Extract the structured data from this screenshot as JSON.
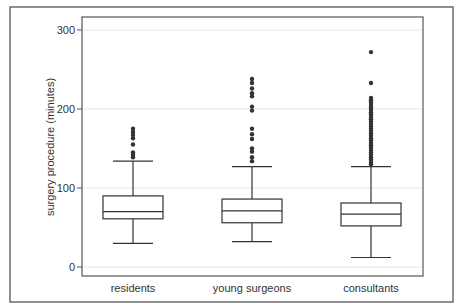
{
  "chart_data": {
    "type": "box",
    "title": "",
    "xlabel": "",
    "ylabel": "surgery procedure (minutes)",
    "ylim": [
      -10,
      310
    ],
    "yticks": [
      0,
      100,
      200,
      300
    ],
    "grid": "horizontal",
    "categories": [
      "residents",
      "young surgeons",
      "consultants"
    ],
    "series": [
      {
        "name": "residents",
        "whisker_low": 30,
        "q1": 61,
        "median": 70,
        "q3": 90,
        "whisker_high": 134,
        "outliers": [
          139,
          142,
          145,
          155,
          163,
          167,
          171,
          175
        ]
      },
      {
        "name": "young surgeons",
        "whisker_low": 32,
        "q1": 56,
        "median": 71,
        "q3": 86,
        "whisker_high": 127,
        "outliers": [
          134,
          139,
          146,
          150,
          162,
          168,
          175,
          198,
          203,
          216,
          220,
          226,
          233,
          238
        ]
      },
      {
        "name": "consultants",
        "whisker_low": 12,
        "q1": 52,
        "median": 67,
        "q3": 81,
        "whisker_high": 127,
        "outliers": [
          130,
          133,
          136,
          139,
          142,
          145,
          148,
          151,
          154,
          157,
          160,
          163,
          166,
          169,
          172,
          175,
          178,
          181,
          184,
          187,
          190,
          193,
          196,
          199,
          202,
          205,
          208,
          211,
          214,
          233,
          272
        ]
      }
    ]
  },
  "labels": {
    "ylabel": "surgery procedure (minutes)",
    "yticks": [
      "0",
      "100",
      "200",
      "300"
    ],
    "categories": [
      "residents",
      "young surgeons",
      "consultants"
    ]
  }
}
